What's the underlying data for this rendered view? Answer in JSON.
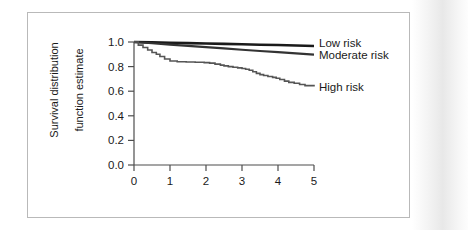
{
  "figure": {
    "background_color": "#ffffff",
    "border_color": "#b9b9b9",
    "axis_color": "#4d4d4d"
  },
  "axis": {
    "y_title_line1": "Survival distribution",
    "y_title_line2": "function estimate",
    "y_ticks": [
      "0.0",
      "0.2",
      "0.4",
      "0.6",
      "0.8",
      "1.0"
    ],
    "x_ticks": [
      "0",
      "1",
      "2",
      "3",
      "4",
      "5"
    ]
  },
  "legend": [
    {
      "label": "Low risk",
      "color": "#1a1a1a"
    },
    {
      "label": "Moderate risk",
      "color": "#333333"
    },
    {
      "label": "High risk",
      "color": "#555555"
    }
  ],
  "chart_data": {
    "type": "line",
    "title": "",
    "xlabel": "",
    "ylabel": "Survival distribution function estimate",
    "xlim": [
      0,
      5
    ],
    "ylim": [
      0.0,
      1.0
    ],
    "xticks": [
      0,
      1,
      2,
      3,
      4,
      5
    ],
    "yticks": [
      0.0,
      0.2,
      0.4,
      0.6,
      0.8,
      1.0
    ],
    "grid": false,
    "legend_position": "right",
    "series": [
      {
        "name": "Low risk",
        "color": "#1a1a1a",
        "width": 2.6,
        "x": [
          0,
          0.5,
          1,
          1.5,
          2,
          2.5,
          3,
          3.5,
          4,
          4.5,
          5
        ],
        "y": [
          1.0,
          0.997,
          0.994,
          0.991,
          0.988,
          0.985,
          0.982,
          0.978,
          0.975,
          0.972,
          0.968
        ]
      },
      {
        "name": "Moderate risk",
        "color": "#333333",
        "width": 2.2,
        "x": [
          0,
          0.5,
          1,
          1.5,
          2,
          2.5,
          3,
          3.5,
          4,
          4.5,
          5
        ],
        "y": [
          1.0,
          0.99,
          0.979,
          0.969,
          0.958,
          0.948,
          0.937,
          0.927,
          0.917,
          0.907,
          0.898
        ]
      },
      {
        "name": "High risk",
        "color": "#555555",
        "width": 1.6,
        "x": [
          0,
          0.12,
          0.25,
          0.38,
          0.5,
          0.62,
          0.72,
          0.85,
          1.0,
          1.2,
          1.45,
          1.7,
          1.95,
          2.1,
          2.25,
          2.4,
          2.5,
          2.62,
          2.75,
          2.88,
          3.0,
          3.1,
          3.2,
          3.3,
          3.4,
          3.5,
          3.6,
          3.72,
          3.85,
          3.95,
          4.05,
          4.18,
          4.3,
          4.45,
          4.6,
          4.75,
          5.0
        ],
        "y": [
          1.0,
          0.975,
          0.955,
          0.935,
          0.915,
          0.9,
          0.882,
          0.862,
          0.845,
          0.84,
          0.838,
          0.835,
          0.832,
          0.828,
          0.82,
          0.812,
          0.806,
          0.8,
          0.795,
          0.79,
          0.785,
          0.778,
          0.77,
          0.758,
          0.745,
          0.735,
          0.728,
          0.72,
          0.712,
          0.705,
          0.695,
          0.682,
          0.672,
          0.665,
          0.655,
          0.645,
          0.638
        ]
      }
    ]
  }
}
